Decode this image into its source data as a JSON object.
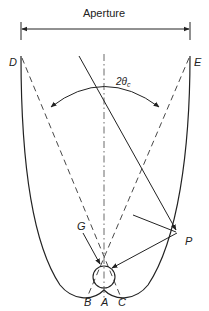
{
  "diagram": {
    "aperture_label": "Aperture",
    "angle_label_main": "2θ",
    "angle_label_sub": "c",
    "points": {
      "D": "D",
      "E": "E",
      "G": "G",
      "P": "P",
      "A": "A",
      "B": "B",
      "C": "C"
    },
    "colors": {
      "stroke": "#222222",
      "dashed": "#333333",
      "background": "#ffffff"
    }
  }
}
